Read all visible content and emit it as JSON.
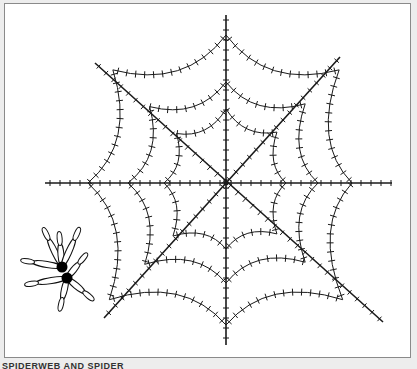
{
  "figure": {
    "caption": "SPIDERWEB AND SPIDER",
    "web": {
      "spokes": 8,
      "rings": 3,
      "stroke_color": "#1a1a1a"
    },
    "spider": {
      "body_color": "#000000",
      "legs": 8
    }
  }
}
